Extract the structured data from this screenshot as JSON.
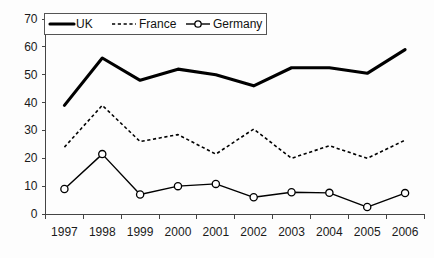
{
  "chart_data": {
    "type": "line",
    "title": "",
    "xlabel": "",
    "ylabel": "",
    "categories": [
      "1997",
      "1998",
      "1999",
      "2000",
      "2001",
      "2002",
      "2003",
      "2004",
      "2005",
      "2006"
    ],
    "ylim": [
      0,
      70
    ],
    "yticks": [
      0,
      10,
      20,
      30,
      40,
      50,
      60,
      70
    ],
    "grid": false,
    "legend_position": "top-left",
    "series": [
      {
        "name": "UK",
        "style": "solid-thick",
        "color": "#000000",
        "marker": "none",
        "values": [
          39,
          56,
          48,
          52,
          50,
          46,
          52.5,
          52.5,
          50.5,
          59
        ]
      },
      {
        "name": "France",
        "style": "dotted",
        "color": "#000000",
        "marker": "none",
        "values": [
          24,
          39,
          26,
          28.5,
          21.5,
          30.5,
          20,
          24.5,
          20,
          26.5
        ]
      },
      {
        "name": "Germany",
        "style": "solid-thin",
        "color": "#000000",
        "marker": "open-circle",
        "values": [
          9,
          21.5,
          7,
          10,
          10.8,
          6,
          7.8,
          7.6,
          2.5,
          7.5
        ]
      }
    ]
  },
  "legend": {
    "items": [
      {
        "label": "UK"
      },
      {
        "label": "France"
      },
      {
        "label": "Germany"
      }
    ]
  }
}
